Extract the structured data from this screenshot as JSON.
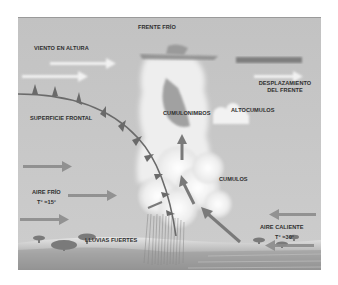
{
  "diagram": {
    "title": "FRENTE FRÍO",
    "labels": {
      "upper_wind": "VIENTO EN ALTURA",
      "frontal_surface": "SUPERFICIE FRONTAL",
      "cumulonimbus": "CUMULONIMBOS",
      "altocumulus": "ALTOCUMULOS",
      "front_movement_line1": "DESPLAZAMIENTO",
      "front_movement_line2": "DEL FRENTE",
      "cumulus": "CUMULOS",
      "cold_air": "AIRE FRÍO",
      "cold_air_temp": "T° ≈15°",
      "warm_air": "AIRE CALIENTE",
      "warm_air_temp": "T° ≈30°",
      "heavy_rain": "LLUVIAS FUERTES"
    },
    "colors": {
      "background": "#c4c4c4",
      "front_line": "#6e6e6e",
      "arrow": "#8a8a8a",
      "wind_arrow": "#f2f2f2",
      "cloud": "#f4f4f4",
      "text": "#2e2e2e"
    }
  }
}
